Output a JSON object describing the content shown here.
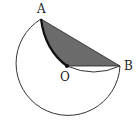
{
  "figure": {
    "points": [
      {
        "name": "A",
        "x": 41,
        "y": 19
      },
      {
        "name": "O",
        "x": 67,
        "y": 66
      },
      {
        "name": "B",
        "x": 120,
        "y": 66
      }
    ],
    "labels": {
      "A": "A",
      "O": "O",
      "B": "B"
    },
    "shaded_region": "area bounded by chord AB, segment OB and arc AO",
    "colors": {
      "shade": "#6b6b6b",
      "stroke": "#222222"
    }
  }
}
